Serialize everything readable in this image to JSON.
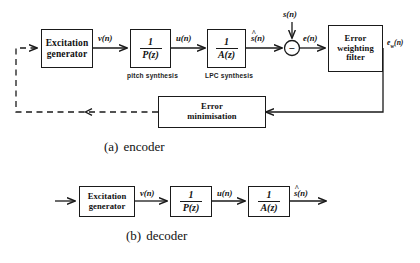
{
  "figure": {
    "line_color": "#1a1a1a",
    "background": "#ffffff"
  },
  "encoder": {
    "caption_label": "(a)",
    "caption_text": "encoder",
    "blocks": {
      "excitation_generator": {
        "line1": "Excitation",
        "line2": "generator"
      },
      "pitch_synthesis": {
        "numerator": "1",
        "denominator": "P(z)",
        "annotation": "pitch synthesis"
      },
      "lpc_synthesis": {
        "numerator": "1",
        "denominator": "A(z)",
        "annotation": "LPC synthesis"
      },
      "error_weighting_filter": {
        "line1": "Error",
        "line2": "weighting",
        "line3": "filter"
      },
      "error_minimisation": {
        "line1": "Error",
        "line2": "minimisation"
      },
      "summing_node": {
        "sign": "−"
      }
    },
    "signals": {
      "excitation_out": "v(n)",
      "pitch_out": "u(n)",
      "lpc_out_hat": "s(n)",
      "input_speech": "s(n)",
      "error": "e(n)",
      "weighted_error": "e",
      "weighted_error_sub": "w",
      "weighted_error_tail": "(n)"
    }
  },
  "decoder": {
    "caption_label": "(b)",
    "caption_text": "decoder",
    "blocks": {
      "excitation_generator": {
        "line1": "Excitation",
        "line2": "generator"
      },
      "pitch_synthesis": {
        "numerator": "1",
        "denominator": "P(z)"
      },
      "lpc_synthesis": {
        "numerator": "1",
        "denominator": "A(z)"
      }
    },
    "signals": {
      "excitation_out": "v(n)",
      "pitch_out": "u(n)",
      "lpc_out_hat": "s(n)"
    }
  }
}
